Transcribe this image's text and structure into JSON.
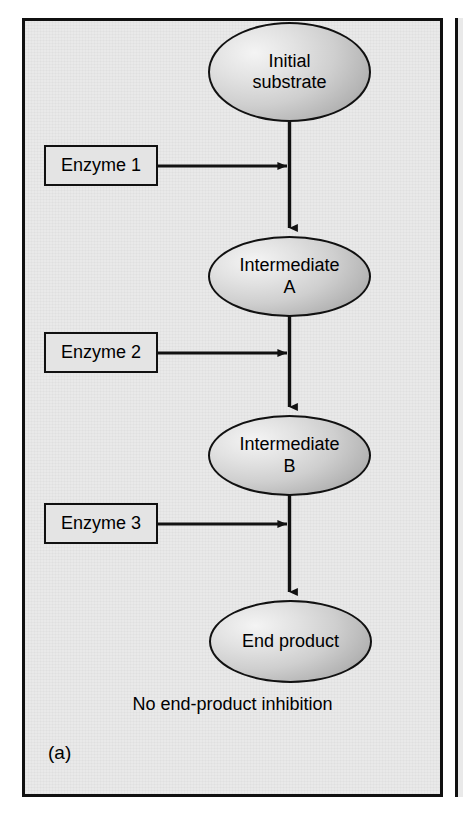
{
  "figure": {
    "panel_letter": "(a)",
    "note": "No end-product inhibition",
    "pathway_title": "Linear enzymatic pathway without end-product inhibition",
    "colors": {
      "panel_background": "#e9e9e9",
      "panel_border": "#101010",
      "node_fill_light": "#f4f4f4",
      "node_fill_dark": "#7d7d7d",
      "box_fill": "#e4e4e4",
      "stroke": "#111111",
      "text": "#000000"
    }
  },
  "nodes": [
    {
      "id": "initial-substrate",
      "label": "Initial\nsubstrate",
      "shape": "ellipse"
    },
    {
      "id": "intermediate-a",
      "label": "Intermediate\nA",
      "shape": "ellipse"
    },
    {
      "id": "intermediate-b",
      "label": "Intermediate\nB",
      "shape": "ellipse"
    },
    {
      "id": "end-product",
      "label": "End product",
      "shape": "ellipse"
    }
  ],
  "enzymes": [
    {
      "id": "enzyme-1",
      "label": "Enzyme 1"
    },
    {
      "id": "enzyme-2",
      "label": "Enzyme 2"
    },
    {
      "id": "enzyme-3",
      "label": "Enzyme 3"
    }
  ],
  "connectors": {
    "vertical_flow": [
      {
        "from": "initial-substrate",
        "to": "intermediate-a",
        "arrow": "down"
      },
      {
        "from": "intermediate-a",
        "to": "intermediate-b",
        "arrow": "down"
      },
      {
        "from": "intermediate-b",
        "to": "end-product",
        "arrow": "down"
      }
    ],
    "enzyme_arrows": [
      {
        "from": "enzyme-1",
        "to": "step-1",
        "arrow": "right"
      },
      {
        "from": "enzyme-2",
        "to": "step-2",
        "arrow": "right"
      },
      {
        "from": "enzyme-3",
        "to": "step-3",
        "arrow": "right"
      }
    ]
  }
}
